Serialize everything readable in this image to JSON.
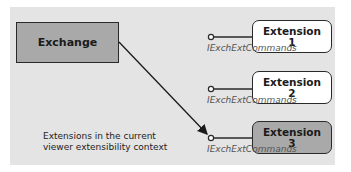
{
  "host": {
    "label": "Exchange"
  },
  "extensions": [
    {
      "line1": "Extension",
      "line2": "1",
      "fill": "white",
      "interface": "IExchExtCommands"
    },
    {
      "line1": "Extension",
      "line2": "2",
      "fill": "white",
      "interface": "IExchExtCommands"
    },
    {
      "line1": "Extension",
      "line2": "3",
      "fill": "grey",
      "interface": "IExchExtCommands"
    }
  ],
  "caption": {
    "line1": "Extensions in the current",
    "line2": "viewer extensibility context"
  },
  "colors": {
    "panel": "#e4e4e4",
    "grey_box": "#a9a9a9",
    "border": "#2a2a2a"
  }
}
